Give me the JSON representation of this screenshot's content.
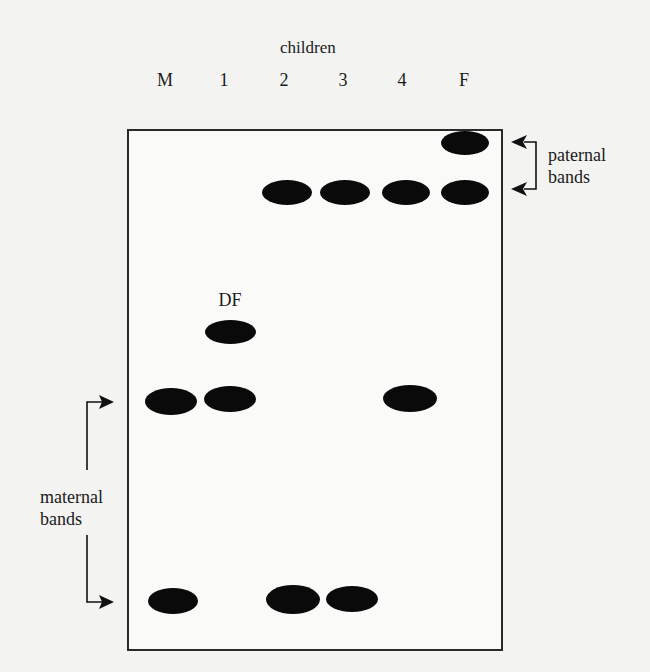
{
  "figure": {
    "group_label": "children",
    "lanes": [
      {
        "id": "M",
        "label": "M"
      },
      {
        "id": "1",
        "label": "1"
      },
      {
        "id": "2",
        "label": "2"
      },
      {
        "id": "3",
        "label": "3"
      },
      {
        "id": "4",
        "label": "4"
      },
      {
        "id": "F",
        "label": "F"
      }
    ],
    "band_annotation": "DF",
    "paternal_label_line1": "paternal",
    "paternal_label_line2": "bands",
    "maternal_label_line1": "maternal",
    "maternal_label_line2": "bands",
    "band_color": "#0a0a0a",
    "border_color": "#2a2a2a",
    "background_color": "#f3f3f1"
  },
  "bands": [
    {
      "lane": "F",
      "row": "paternal-upper",
      "x": 441,
      "y": 131,
      "w": 48,
      "h": 24
    },
    {
      "lane": "2",
      "row": "paternal-lower",
      "x": 262,
      "y": 180,
      "w": 50,
      "h": 25
    },
    {
      "lane": "3",
      "row": "paternal-lower",
      "x": 320,
      "y": 180,
      "w": 50,
      "h": 25
    },
    {
      "lane": "4",
      "row": "paternal-lower",
      "x": 382,
      "y": 180,
      "w": 48,
      "h": 25
    },
    {
      "lane": "F",
      "row": "paternal-lower",
      "x": 441,
      "y": 180,
      "w": 48,
      "h": 25
    },
    {
      "lane": "1",
      "row": "DF",
      "x": 205,
      "y": 320,
      "w": 51,
      "h": 24
    },
    {
      "lane": "M",
      "row": "maternal-upper",
      "x": 145,
      "y": 388,
      "w": 52,
      "h": 27
    },
    {
      "lane": "1",
      "row": "maternal-upper",
      "x": 204,
      "y": 386,
      "w": 52,
      "h": 26
    },
    {
      "lane": "4",
      "row": "maternal-upper",
      "x": 383,
      "y": 385,
      "w": 54,
      "h": 27
    },
    {
      "lane": "M",
      "row": "maternal-lower",
      "x": 148,
      "y": 588,
      "w": 50,
      "h": 26
    },
    {
      "lane": "2",
      "row": "maternal-lower",
      "x": 266,
      "y": 585,
      "w": 54,
      "h": 29
    },
    {
      "lane": "3",
      "row": "maternal-lower",
      "x": 326,
      "y": 586,
      "w": 52,
      "h": 26
    }
  ]
}
